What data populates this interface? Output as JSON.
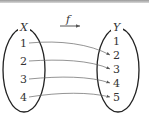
{
  "diagram": {
    "function_label": "f",
    "domain": {
      "name": "X",
      "elements": [
        "1",
        "2",
        "3",
        "4"
      ]
    },
    "codomain": {
      "name": "Y",
      "elements": [
        "1",
        "2",
        "3",
        "4",
        "5"
      ]
    },
    "mappings": [
      {
        "from": "1",
        "to": "2"
      },
      {
        "from": "2",
        "to": "3"
      },
      {
        "from": "3",
        "to": "4"
      },
      {
        "from": "4",
        "to": "5"
      }
    ],
    "colors": {
      "stroke": "#222222",
      "arrow": "#555555",
      "text": "#333333"
    }
  }
}
